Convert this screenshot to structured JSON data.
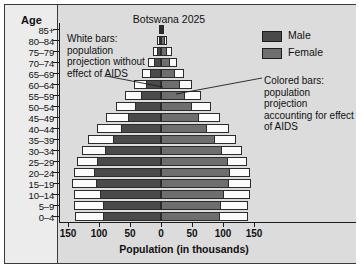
{
  "chart_data": {
    "type": "bar",
    "title": "Botswana 2025",
    "xlabel": "Population (in thousands)",
    "ylabel": "Age",
    "xlim": [
      -150,
      150
    ],
    "xticks": [
      150,
      100,
      50,
      0,
      50,
      100,
      150
    ],
    "grid": false,
    "legend_position": "top-right",
    "categories": [
      "85+",
      "80–84",
      "75–79",
      "70–74",
      "65–69",
      "60–64",
      "55–59",
      "50–54",
      "45–49",
      "40–44",
      "35–39",
      "30–34",
      "25–29",
      "20–24",
      "15–19",
      "10–14",
      "5–9",
      "0–4"
    ],
    "series": [
      {
        "name": "Male",
        "side": "left",
        "kind": "with-aids",
        "values": [
          2,
          4,
          7,
          11,
          17,
          24,
          32,
          42,
          53,
          65,
          78,
          91,
          103,
          108,
          105,
          98,
          94,
          93
        ]
      },
      {
        "name": "Male projection without AIDS",
        "side": "left",
        "kind": "without-aids",
        "values": [
          3,
          7,
          13,
          21,
          31,
          44,
          58,
          73,
          88,
          103,
          117,
          128,
          136,
          141,
          143,
          141,
          140,
          139
        ]
      },
      {
        "name": "Female",
        "side": "right",
        "kind": "with-aids",
        "values": [
          3,
          6,
          10,
          15,
          22,
          30,
          39,
          50,
          62,
          74,
          87,
          99,
          108,
          112,
          110,
          102,
          97,
          95
        ]
      },
      {
        "name": "Female projection without AIDS",
        "side": "right",
        "kind": "without-aids",
        "values": [
          5,
          10,
          17,
          26,
          37,
          50,
          65,
          80,
          95,
          109,
          121,
          131,
          138,
          143,
          145,
          143,
          141,
          140
        ]
      }
    ]
  },
  "header": {
    "title": "Botswana 2025",
    "age_column_header": "Age"
  },
  "legend": {
    "items": [
      {
        "label": "Male",
        "color": "#4a4a4a"
      },
      {
        "label": "Female",
        "color": "#6e6e6e"
      }
    ]
  },
  "annotations": {
    "left": "White bars: population projection without effect of AIDS",
    "right": "Colored bars: population projection accounting for effect of AIDS"
  },
  "axis": {
    "x_title": "Population (in thousands)",
    "x_tick_labels": [
      "150",
      "100",
      "50",
      "0",
      "50",
      "100",
      "150"
    ]
  },
  "colors": {
    "male": "#4a4a4a",
    "female": "#6e6e6e",
    "white_bar": "#fbfbfb",
    "panel": "#dcdcdc",
    "age_panel": "#ececec",
    "ink": "#1c1c1c"
  }
}
